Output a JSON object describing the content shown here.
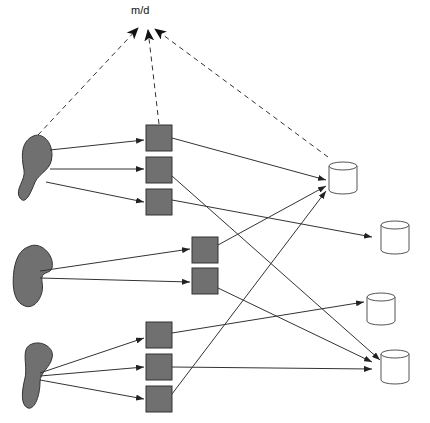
{
  "diagram": {
    "top_label": "m/d",
    "colors": {
      "node_fill": "#707070",
      "node_stroke": "#333333",
      "edge": "#333333",
      "db_fill": "#ffffff",
      "db_stroke": "#555555"
    },
    "sources": [
      {
        "id": "source-1",
        "shape": "blob"
      },
      {
        "id": "source-2",
        "shape": "blob"
      },
      {
        "id": "source-3",
        "shape": "blob"
      }
    ],
    "processors": [
      {
        "id": "p1"
      },
      {
        "id": "p2"
      },
      {
        "id": "p3"
      },
      {
        "id": "p4"
      },
      {
        "id": "p5"
      },
      {
        "id": "p6"
      },
      {
        "id": "p7"
      },
      {
        "id": "p8"
      }
    ],
    "stores": [
      {
        "id": "db1"
      },
      {
        "id": "db2"
      },
      {
        "id": "db3"
      },
      {
        "id": "db4"
      }
    ]
  }
}
